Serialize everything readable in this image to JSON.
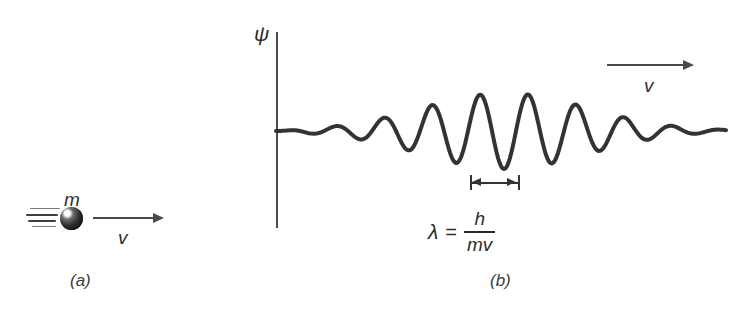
{
  "figure": {
    "background_color": "#ffffff",
    "ink_color": "#333333",
    "width": 748,
    "height": 316
  },
  "panel_a": {
    "caption": "(a)",
    "mass_label": "m",
    "velocity_label": "v",
    "particle": {
      "icon": "sphere-particle-icon",
      "motion_lines": 4
    },
    "arrow": {
      "icon": "arrow-right-icon",
      "direction": "right"
    }
  },
  "panel_b": {
    "caption": "(b)",
    "axis_label": "ψ",
    "velocity_label": "v",
    "arrow": {
      "icon": "arrow-right-icon",
      "direction": "right"
    },
    "wavelength_marker": {
      "icon": "dimension-arrow-icon",
      "label": "λ"
    },
    "equation": {
      "lhs": "λ",
      "relation": "=",
      "numerator": "h",
      "denominator": "mv",
      "plain_text": "λ = h/mv"
    }
  },
  "chart_data": {
    "type": "line",
    "title": "",
    "xlabel": "",
    "ylabel": "ψ",
    "grid": false,
    "legend": null,
    "axis": {
      "vertical_line_x": 276,
      "vertical_line_y_top": 32,
      "vertical_line_y_bottom": 228,
      "baseline_y": 131
    },
    "wave": {
      "x_start": 276,
      "x_end": 726,
      "baseline_y": 131,
      "wavelength_px": 48,
      "peak_count": 8,
      "max_amplitude_px": 38,
      "envelope": "gaussian",
      "envelope_center_x": 505,
      "envelope_sigma_px": 118,
      "stroke_width": 4
    },
    "wavelength_marker": {
      "x_left": 470,
      "x_right": 518,
      "y": 182,
      "measured_wavelength_px": 48
    }
  }
}
